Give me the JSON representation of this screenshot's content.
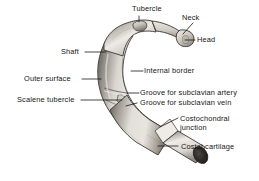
{
  "figure": {
    "background_color": "#ffffff",
    "ink_color": "#161616",
    "bone_light": "#e7e4df",
    "bone_mid": "#b3aea6",
    "bone_dark": "#6d6862",
    "cartilage_light": "#efece8",
    "cut_surface": "#2a2724"
  },
  "labels": [
    {
      "id": "tubercle",
      "text": "Tubercle",
      "x": 132,
      "y": 4
    },
    {
      "id": "neck",
      "text": "Neck",
      "x": 182,
      "y": 13
    },
    {
      "id": "head",
      "text": "Head",
      "x": 197,
      "y": 35
    },
    {
      "id": "shaft",
      "text": "Shaft",
      "x": 61,
      "y": 47
    },
    {
      "id": "internal-border",
      "text": "Internal border",
      "x": 144,
      "y": 66
    },
    {
      "id": "outer-surface",
      "text": "Outer surface",
      "x": 24,
      "y": 74
    },
    {
      "id": "groove-artery",
      "text": "Groove for subclavian artery",
      "x": 140,
      "y": 88
    },
    {
      "id": "groove-vein",
      "text": "Groove for subclavian vein",
      "x": 140,
      "y": 98
    },
    {
      "id": "scalene-tubercle",
      "text": "Scalene tubercle",
      "x": 17,
      "y": 95
    },
    {
      "id": "costochondral",
      "text": "Costochondral junction",
      "x": 180,
      "y": 114
    },
    {
      "id": "costal-cartilage",
      "text": "Costal cartilage",
      "x": 181,
      "y": 142
    }
  ],
  "leader_lines": [
    {
      "id": "tubercle-leader",
      "points": "139,16 139,22"
    },
    {
      "id": "neck-leader",
      "points": "193,23 183,34"
    },
    {
      "id": "head-leader",
      "points": "195,40 185,40"
    },
    {
      "id": "shaft-leader",
      "points": "85,52 106,52"
    },
    {
      "id": "internal-border-leader",
      "points": "131,71 143,71"
    },
    {
      "id": "outer-surface-leader",
      "points": "82,79 101,79"
    },
    {
      "id": "groove-artery-leader",
      "points": "127,93 139,93"
    },
    {
      "id": "groove-vein-leader",
      "points": "126,106 137,103"
    },
    {
      "id": "scalene-tubercle-leader",
      "points": "81,100 122,100"
    },
    {
      "id": "costochondral-leader",
      "points": "160,127 178,118"
    },
    {
      "id": "costal-cartilage-leader",
      "points": "158,146 178,146"
    }
  ]
}
